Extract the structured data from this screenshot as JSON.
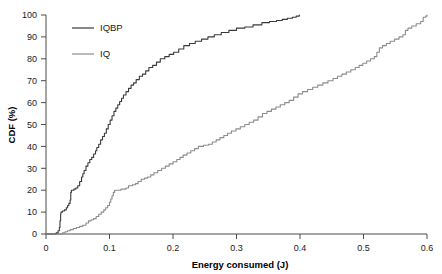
{
  "chart_data": {
    "type": "line",
    "title": "",
    "xlabel": "Energy consumed (J)",
    "ylabel": "CDF (%)",
    "xlim": [
      0,
      0.6
    ],
    "ylim": [
      0,
      100
    ],
    "xticks": [
      "0",
      "0.1",
      "0.2",
      "0.3",
      "0.4",
      "0.5",
      "0.6"
    ],
    "xtick_values": [
      0,
      0.1,
      0.2,
      0.3,
      0.4,
      0.5,
      0.6
    ],
    "yticks": [
      "0",
      "10",
      "20",
      "30",
      "40",
      "50",
      "60",
      "70",
      "80",
      "90",
      "100"
    ],
    "ytick_values": [
      0,
      10,
      20,
      30,
      40,
      50,
      60,
      70,
      80,
      90,
      100
    ],
    "grid": false,
    "legend_position": "top-left",
    "series": [
      {
        "name": "IQBP",
        "color": "#3a3a3a",
        "points": [
          [
            0.0,
            0
          ],
          [
            0.012,
            0
          ],
          [
            0.016,
            0.5
          ],
          [
            0.019,
            1.5
          ],
          [
            0.021,
            3
          ],
          [
            0.022,
            6
          ],
          [
            0.023,
            9
          ],
          [
            0.0235,
            10
          ],
          [
            0.026,
            10.5
          ],
          [
            0.029,
            11
          ],
          [
            0.032,
            12
          ],
          [
            0.034,
            13
          ],
          [
            0.036,
            14
          ],
          [
            0.038,
            15.5
          ],
          [
            0.039,
            19
          ],
          [
            0.04,
            20
          ],
          [
            0.044,
            20.5
          ],
          [
            0.047,
            21
          ],
          [
            0.05,
            22
          ],
          [
            0.053,
            24
          ],
          [
            0.056,
            26
          ],
          [
            0.058,
            27.5
          ],
          [
            0.06,
            29
          ],
          [
            0.063,
            31
          ],
          [
            0.066,
            32.5
          ],
          [
            0.069,
            34
          ],
          [
            0.072,
            35
          ],
          [
            0.075,
            36.5
          ],
          [
            0.078,
            38
          ],
          [
            0.08,
            39.5
          ],
          [
            0.083,
            41
          ],
          [
            0.086,
            43
          ],
          [
            0.089,
            44.5
          ],
          [
            0.092,
            46
          ],
          [
            0.095,
            48
          ],
          [
            0.098,
            50
          ],
          [
            0.101,
            52
          ],
          [
            0.104,
            54
          ],
          [
            0.107,
            56
          ],
          [
            0.11,
            57.5
          ],
          [
            0.113,
            59
          ],
          [
            0.116,
            60.5
          ],
          [
            0.119,
            62
          ],
          [
            0.122,
            63.5
          ],
          [
            0.126,
            65
          ],
          [
            0.13,
            66.5
          ],
          [
            0.134,
            68
          ],
          [
            0.138,
            69
          ],
          [
            0.142,
            70.5
          ],
          [
            0.147,
            72
          ],
          [
            0.152,
            73
          ],
          [
            0.157,
            74.5
          ],
          [
            0.162,
            76
          ],
          [
            0.168,
            77
          ],
          [
            0.174,
            78.5
          ],
          [
            0.18,
            80
          ],
          [
            0.187,
            81
          ],
          [
            0.194,
            82
          ],
          [
            0.201,
            83
          ],
          [
            0.209,
            84.5
          ],
          [
            0.217,
            86
          ],
          [
            0.226,
            87
          ],
          [
            0.235,
            88
          ],
          [
            0.245,
            89
          ],
          [
            0.255,
            90
          ],
          [
            0.265,
            91
          ],
          [
            0.276,
            92
          ],
          [
            0.288,
            93
          ],
          [
            0.3,
            94
          ],
          [
            0.313,
            94.5
          ],
          [
            0.326,
            95.5
          ],
          [
            0.34,
            96.5
          ],
          [
            0.352,
            97
          ],
          [
            0.363,
            97.5
          ],
          [
            0.372,
            98
          ],
          [
            0.38,
            98.5
          ],
          [
            0.388,
            99
          ],
          [
            0.394,
            99.5
          ],
          [
            0.399,
            100
          ]
        ]
      },
      {
        "name": "IQ",
        "color": "#8c8c8c",
        "points": [
          [
            0.0,
            0
          ],
          [
            0.022,
            0
          ],
          [
            0.026,
            0.5
          ],
          [
            0.03,
            1
          ],
          [
            0.034,
            1.5
          ],
          [
            0.038,
            2
          ],
          [
            0.043,
            2.5
          ],
          [
            0.048,
            3
          ],
          [
            0.053,
            3.5
          ],
          [
            0.058,
            4
          ],
          [
            0.063,
            5
          ],
          [
            0.067,
            6
          ],
          [
            0.071,
            6.5
          ],
          [
            0.075,
            7
          ],
          [
            0.079,
            8
          ],
          [
            0.083,
            9
          ],
          [
            0.087,
            10
          ],
          [
            0.091,
            11
          ],
          [
            0.094,
            12
          ],
          [
            0.097,
            13
          ],
          [
            0.1,
            14.5
          ],
          [
            0.102,
            16
          ],
          [
            0.104,
            17.5
          ],
          [
            0.106,
            19
          ],
          [
            0.108,
            20
          ],
          [
            0.118,
            20.5
          ],
          [
            0.126,
            21
          ],
          [
            0.13,
            22
          ],
          [
            0.136,
            22.5
          ],
          [
            0.141,
            23
          ],
          [
            0.145,
            24
          ],
          [
            0.15,
            25
          ],
          [
            0.155,
            25.5
          ],
          [
            0.16,
            26
          ],
          [
            0.165,
            27
          ],
          [
            0.17,
            28
          ],
          [
            0.176,
            29
          ],
          [
            0.182,
            30
          ],
          [
            0.188,
            31
          ],
          [
            0.194,
            32
          ],
          [
            0.2,
            33
          ],
          [
            0.206,
            34
          ],
          [
            0.211,
            35
          ],
          [
            0.216,
            36
          ],
          [
            0.222,
            37
          ],
          [
            0.228,
            38
          ],
          [
            0.234,
            39
          ],
          [
            0.24,
            40
          ],
          [
            0.248,
            40.5
          ],
          [
            0.256,
            41
          ],
          [
            0.262,
            42
          ],
          [
            0.268,
            43
          ],
          [
            0.274,
            44
          ],
          [
            0.28,
            45
          ],
          [
            0.286,
            46
          ],
          [
            0.292,
            47
          ],
          [
            0.299,
            48
          ],
          [
            0.306,
            49
          ],
          [
            0.313,
            50
          ],
          [
            0.32,
            51
          ],
          [
            0.327,
            52
          ],
          [
            0.334,
            53.5
          ],
          [
            0.341,
            55
          ],
          [
            0.348,
            56
          ],
          [
            0.355,
            57
          ],
          [
            0.362,
            58
          ],
          [
            0.369,
            59
          ],
          [
            0.376,
            60
          ],
          [
            0.383,
            61
          ],
          [
            0.39,
            62.5
          ],
          [
            0.397,
            64
          ],
          [
            0.404,
            65
          ],
          [
            0.412,
            66
          ],
          [
            0.42,
            67
          ],
          [
            0.428,
            68
          ],
          [
            0.436,
            69
          ],
          [
            0.444,
            70
          ],
          [
            0.452,
            71
          ],
          [
            0.459,
            72
          ],
          [
            0.466,
            73
          ],
          [
            0.473,
            74
          ],
          [
            0.48,
            75
          ],
          [
            0.487,
            76
          ],
          [
            0.493,
            77
          ],
          [
            0.499,
            78
          ],
          [
            0.505,
            79
          ],
          [
            0.511,
            80
          ],
          [
            0.517,
            81
          ],
          [
            0.521,
            83
          ],
          [
            0.525,
            85
          ],
          [
            0.53,
            86
          ],
          [
            0.536,
            87
          ],
          [
            0.542,
            88
          ],
          [
            0.549,
            89
          ],
          [
            0.556,
            90
          ],
          [
            0.562,
            91
          ],
          [
            0.566,
            93
          ],
          [
            0.57,
            94
          ],
          [
            0.576,
            95
          ],
          [
            0.583,
            96
          ],
          [
            0.59,
            97
          ],
          [
            0.594,
            99
          ],
          [
            0.598,
            99.5
          ],
          [
            0.6,
            100
          ]
        ]
      }
    ]
  },
  "legend": {
    "items": [
      {
        "label": "IQBP",
        "color": "#3a3a3a"
      },
      {
        "label": "IQ",
        "color": "#8c8c8c"
      }
    ]
  },
  "axes": {
    "x_title": "Energy consumed (J)",
    "y_title": "CDF (%)"
  }
}
